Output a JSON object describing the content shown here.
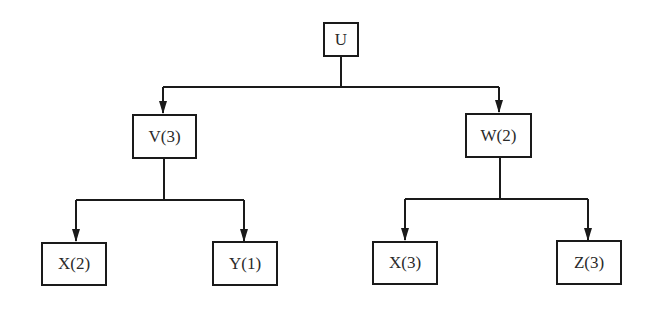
{
  "diagram": {
    "type": "tree",
    "colors": {
      "line": "#1a1a1a",
      "text": "#2a2a2a",
      "background": "#ffffff"
    },
    "nodes": {
      "root": {
        "label": "U"
      },
      "left": {
        "label": "V(3)"
      },
      "right": {
        "label": "W(2)"
      },
      "left_left": {
        "label": "X(2)"
      },
      "left_right": {
        "label": "Y(1)"
      },
      "right_left": {
        "label": "X(3)"
      },
      "right_right": {
        "label": "Z(3)"
      }
    },
    "edges": [
      [
        "U",
        "V(3)"
      ],
      [
        "U",
        "W(2)"
      ],
      [
        "V(3)",
        "X(2)"
      ],
      [
        "V(3)",
        "Y(1)"
      ],
      [
        "W(2)",
        "X(3)"
      ],
      [
        "W(2)",
        "Z(3)"
      ]
    ]
  }
}
